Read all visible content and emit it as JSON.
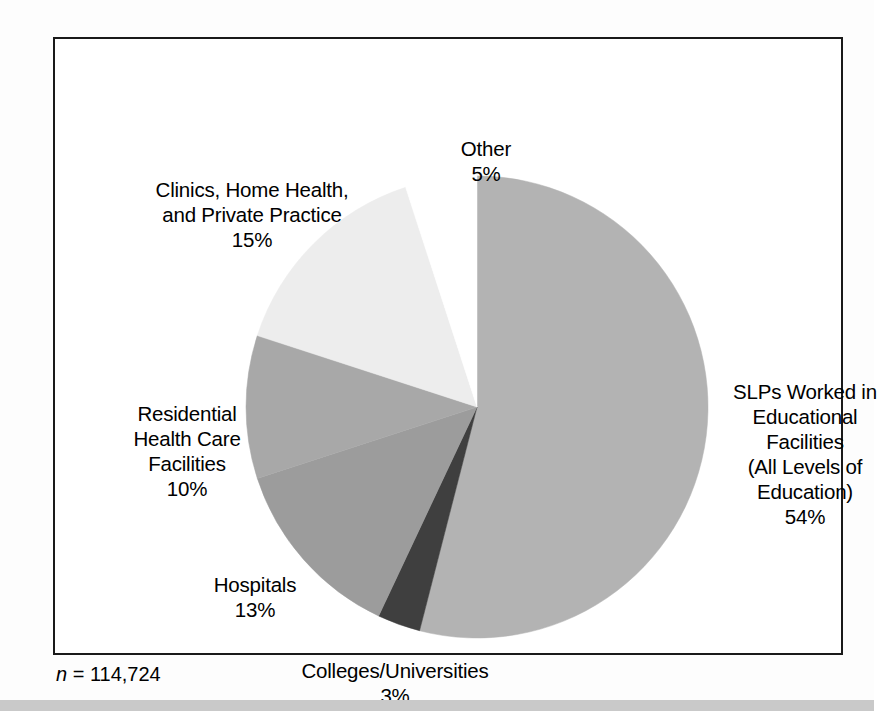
{
  "figure": {
    "footnote_prefix": "n",
    "footnote_rest": " = 114,724",
    "background_color": "#ffffff",
    "frame_color": "#1a1a1a"
  },
  "chart_data": {
    "type": "pie",
    "title": "",
    "subtitle": "",
    "xlabel": "",
    "ylabel": "",
    "legend_position": "none",
    "grid": false,
    "total_n": 114724,
    "total_n_text": "n = 114,724",
    "start_angle_deg": 0,
    "direction": "clockwise",
    "units": "percent",
    "categories": [
      "SLPs Worked in Educational Facilities (All Levels of Education)",
      "Colleges/Universities",
      "Hospitals",
      "Residential Health Care Facilities",
      "Clinics, Home Health, and Private Practice",
      "Other"
    ],
    "values": [
      54,
      3,
      13,
      10,
      15,
      5
    ],
    "colors": [
      "#b3b3b3",
      "#3f3f3f",
      "#9c9c9c",
      "#a8a8a8",
      "#ededed",
      "#ffffff"
    ],
    "slices": [
      {
        "name": "slps-educational",
        "label": "SLPs Worked in\nEducational\nFacilities\n(All Levels of\nEducation)",
        "percent_text": "54%",
        "value": 54,
        "color": "#b3b3b3"
      },
      {
        "name": "colleges-universities",
        "label": "Colleges/Universities",
        "percent_text": "3%",
        "value": 3,
        "color": "#3f3f3f"
      },
      {
        "name": "hospitals",
        "label": "Hospitals",
        "percent_text": "13%",
        "value": 13,
        "color": "#9c9c9c"
      },
      {
        "name": "residential-health-care",
        "label": "Residential\nHealth Care\nFacilities",
        "percent_text": "10%",
        "value": 10,
        "color": "#a8a8a8"
      },
      {
        "name": "clinics-home-health",
        "label": "Clinics, Home Health,\nand Private Practice",
        "percent_text": "15%",
        "value": 15,
        "color": "#ededed"
      },
      {
        "name": "other",
        "label": "Other",
        "percent_text": "5%",
        "value": 5,
        "color": "#ffffff"
      }
    ]
  }
}
